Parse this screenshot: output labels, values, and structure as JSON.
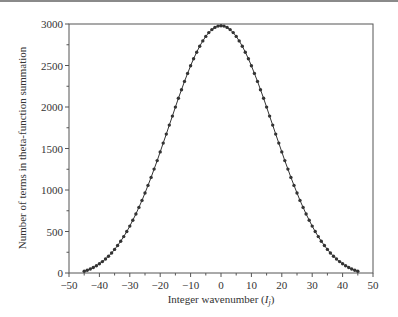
{
  "chart_data": {
    "type": "line",
    "title": "",
    "xlabel": "Integer wavenumber (I_j)",
    "xlabel_main": "Integer wavenumber (",
    "xlabel_var": "I",
    "xlabel_sub": "j",
    "xlabel_close": ")",
    "ylabel": "Number of terms in theta-function summation",
    "xlim": [
      -50,
      50
    ],
    "ylim": [
      0,
      3000
    ],
    "x_ticks": [
      -50,
      -40,
      -30,
      -20,
      -10,
      0,
      10,
      20,
      30,
      40,
      50
    ],
    "x_tick_labels": [
      "−50",
      "−40",
      "−30",
      "−20",
      "−10",
      "0",
      "10",
      "20",
      "30",
      "40",
      "50"
    ],
    "y_ticks": [
      0,
      500,
      1000,
      1500,
      2000,
      2500,
      3000
    ],
    "y_tick_labels": [
      "0",
      "500",
      "1000",
      "1500",
      "2000",
      "2500",
      "3000"
    ],
    "grid": false,
    "legend": null,
    "marker": "filled-circle",
    "color": "#333333",
    "series": [
      {
        "name": "terms",
        "x": [
          -45,
          -44,
          -43,
          -42,
          -41,
          -40,
          -39,
          -38,
          -37,
          -36,
          -35,
          -34,
          -33,
          -32,
          -31,
          -30,
          -29,
          -28,
          -27,
          -26,
          -25,
          -24,
          -23,
          -22,
          -21,
          -20,
          -19,
          -18,
          -17,
          -16,
          -15,
          -14,
          -13,
          -12,
          -11,
          -10,
          -9,
          -8,
          -7,
          -6,
          -5,
          -4,
          -3,
          -2,
          -1,
          0,
          1,
          2,
          3,
          4,
          5,
          6,
          7,
          8,
          9,
          10,
          11,
          12,
          13,
          14,
          15,
          16,
          17,
          18,
          19,
          20,
          21,
          22,
          23,
          24,
          25,
          26,
          27,
          28,
          29,
          30,
          31,
          32,
          33,
          34,
          35,
          36,
          37,
          38,
          39,
          40,
          41,
          42,
          43,
          44,
          45
        ],
        "values": [
          15,
          20,
          27,
          36,
          48,
          63,
          82,
          106,
          136,
          173,
          217,
          270,
          332,
          404,
          486,
          578,
          681,
          794,
          917,
          1050,
          1191,
          1339,
          1493,
          1651,
          1811,
          1970,
          2127,
          2279,
          2424,
          2559,
          2683,
          2793,
          2888,
          2966,
          3026,
          3066,
          2998,
          2994,
          2996,
          2998,
          2996,
          2990,
          2985,
          2980,
          2980,
          2980,
          2980,
          2980,
          2985,
          2990,
          2996,
          2998,
          2996,
          2994,
          2998,
          3066,
          3026,
          2966,
          2888,
          2793,
          2683,
          2559,
          2424,
          2279,
          2127,
          1970,
          1811,
          1651,
          1493,
          1339,
          1191,
          1050,
          917,
          794,
          681,
          578,
          486,
          404,
          332,
          270,
          217,
          173,
          136,
          106,
          82,
          63,
          48,
          36,
          27,
          20,
          15
        ]
      }
    ]
  }
}
